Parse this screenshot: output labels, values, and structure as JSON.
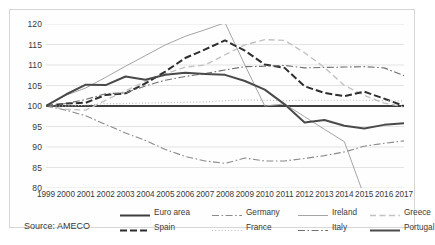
{
  "figure": {
    "source_note": "Source: AMECO",
    "caption": ""
  },
  "chart_data": {
    "type": "line",
    "title": "",
    "xlabel": "",
    "ylabel": "",
    "xlim": [
      1999,
      2017
    ],
    "ylim": [
      80,
      120
    ],
    "yticks": [
      80,
      85,
      90,
      95,
      100,
      105,
      110,
      115,
      120
    ],
    "grid": true,
    "legend_position": "bottom",
    "x": [
      1999,
      2000,
      2001,
      2002,
      2003,
      2004,
      2005,
      2006,
      2007,
      2008,
      2009,
      2010,
      2011,
      2012,
      2013,
      2014,
      2015,
      2016,
      2017
    ],
    "categories": [
      "1999",
      "2000",
      "2001",
      "2002",
      "2003",
      "2004",
      "2005",
      "2006",
      "2007",
      "2008",
      "2009",
      "2010",
      "2011",
      "2012",
      "2013",
      "2014",
      "2015",
      "2016",
      "2017"
    ],
    "series": [
      {
        "name": "Euro area",
        "style": "solid",
        "weight": "bold",
        "color": "#3f3f3f",
        "values": [
          100,
          100,
          100,
          100,
          100,
          100,
          100,
          100,
          100,
          100,
          100,
          100,
          100,
          100,
          100,
          100,
          100,
          100,
          100
        ]
      },
      {
        "name": "Germany",
        "style": "dash-dot",
        "weight": "normal",
        "color": "#8a8a8a",
        "values": [
          100,
          99.0,
          97.6,
          95.5,
          93.4,
          91.6,
          89.4,
          87.7,
          86.6,
          86.0,
          87.3,
          86.6,
          86.6,
          87.2,
          87.9,
          88.8,
          90.2,
          90.9,
          91.5
        ]
      },
      {
        "name": "Ireland",
        "style": "solid",
        "weight": "thin",
        "color": "#9a9a9a",
        "values": [
          100,
          102.6,
          104.4,
          107.0,
          109.7,
          112.3,
          114.9,
          117.0,
          118.6,
          120.3,
          110.0,
          100.0,
          100.5,
          97.4,
          94.3,
          91.3,
          78.0,
          null,
          null
        ]
      },
      {
        "name": "Greece",
        "style": "dashed",
        "weight": "light",
        "color": "#c2c2c2",
        "values": [
          100,
          99.2,
          99.0,
          101.4,
          103.7,
          106.0,
          107.8,
          109.5,
          110.0,
          112.5,
          114.9,
          116.2,
          116.0,
          113.0,
          109.4,
          105.0,
          102.6,
          100.7,
          99.8
        ]
      },
      {
        "name": "Spain",
        "style": "dashed",
        "weight": "bold",
        "color": "#2e2e2e",
        "values": [
          100,
          100.6,
          100.8,
          102.7,
          103.1,
          105.5,
          108.4,
          111.7,
          113.8,
          116.0,
          113.5,
          110.1,
          109.3,
          104.8,
          103.2,
          102.4,
          103.5,
          101.8,
          100.0
        ]
      },
      {
        "name": "France",
        "style": "dotted",
        "weight": "light",
        "color": "#bcbcbc",
        "values": [
          100,
          100.0,
          100.2,
          100.6,
          100.6,
          100.7,
          100.8,
          100.9,
          101.0,
          101.3,
          101.5,
          101.4,
          101.3,
          101.4,
          101.4,
          101.4,
          101.4,
          101.3,
          101.2
        ]
      },
      {
        "name": "Italy",
        "style": "dash-dot",
        "weight": "normal",
        "color": "#6f6f6f",
        "values": [
          100,
          100.6,
          101.6,
          103.0,
          103.2,
          104.9,
          106.3,
          107.2,
          107.9,
          108.8,
          109.6,
          109.7,
          109.9,
          109.3,
          109.4,
          109.5,
          109.6,
          109.3,
          107.4
        ]
      },
      {
        "name": "Portugal",
        "style": "solid",
        "weight": "bold",
        "color": "#4a4a4a",
        "values": [
          100,
          102.8,
          105.2,
          105.1,
          107.2,
          106.4,
          107.6,
          108.1,
          107.8,
          107.6,
          106.1,
          104.0,
          100.4,
          96.0,
          96.6,
          95.2,
          94.5,
          95.4,
          95.8
        ]
      }
    ]
  },
  "yaxis": {
    "labels": [
      "120",
      "115",
      "110",
      "105",
      "100",
      "95",
      "90",
      "85",
      "80"
    ]
  },
  "legend": {
    "items": [
      {
        "label": "Euro area",
        "style": "solid-bold"
      },
      {
        "label": "Germany",
        "style": "dash-dot"
      },
      {
        "label": "Ireland",
        "style": "solid-thin"
      },
      {
        "label": "Greece",
        "style": "dashed-light"
      },
      {
        "label": "Spain",
        "style": "dashed-bold"
      },
      {
        "label": "France",
        "style": "dotted"
      },
      {
        "label": "Italy",
        "style": "dash-dot-dark"
      },
      {
        "label": "Portugal",
        "style": "solid-bold2"
      }
    ]
  }
}
